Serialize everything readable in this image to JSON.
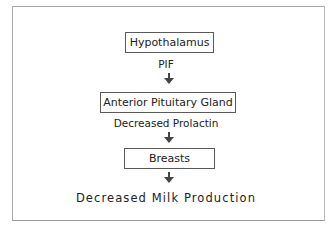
{
  "diagram": {
    "nodes": [
      {
        "id": "hypothalamus",
        "label": "Hypothalamus"
      },
      {
        "id": "anterior-pituitary",
        "label": "Anterior Pituitary Gland"
      },
      {
        "id": "breasts",
        "label": "Breasts"
      }
    ],
    "edges": [
      {
        "from": "hypothalamus",
        "to": "anterior-pituitary",
        "label": "PIF"
      },
      {
        "from": "anterior-pituitary",
        "to": "breasts",
        "label": "Decreased Prolactin"
      },
      {
        "from": "breasts",
        "to": "outcome",
        "label": ""
      }
    ],
    "outcome": "Decreased Milk Production"
  },
  "colors": {
    "frame_border": "#a9a9a9",
    "box_border": "#5a5a5a",
    "arrow": "#444444",
    "text": "#222222"
  }
}
